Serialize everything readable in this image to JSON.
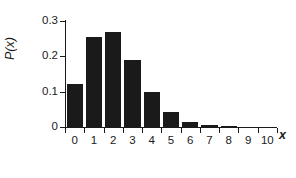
{
  "chart_data": {
    "type": "bar",
    "title": "",
    "subtitle": "",
    "xlabel": "x",
    "ylabel": "P(x)",
    "categories": [
      "0",
      "1",
      "2",
      "3",
      "4",
      "5",
      "6",
      "7",
      "8",
      "9",
      "10"
    ],
    "values": [
      0.122,
      0.256,
      0.27,
      0.189,
      0.099,
      0.042,
      0.013,
      0.005,
      0.001,
      0.0,
      0.0
    ],
    "xlim": [
      -0.5,
      10.5
    ],
    "ylim": [
      0,
      0.3
    ],
    "ytick_labels": [
      "0.3",
      "0.2",
      "0.1",
      "0"
    ],
    "ytick_values": [
      0.3,
      0.2,
      0.1,
      0
    ],
    "xtick_labels": [
      "0",
      "1",
      "2",
      "3",
      "4",
      "5",
      "6",
      "7",
      "8",
      "9",
      "10"
    ],
    "grid": false,
    "legend": null,
    "bar_color": "#1a1a1a",
    "axis_color": "#1a1a1a",
    "background_color": "#ffffff"
  }
}
